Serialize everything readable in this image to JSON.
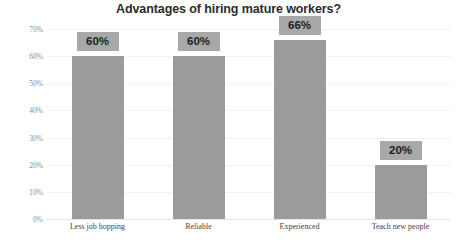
{
  "chart_data": {
    "type": "bar",
    "title": "Advantages of hiring mature workers?",
    "subtitle": "",
    "xlabel": "",
    "ylabel": "",
    "categories": [
      "Less job hopping",
      "Reliable",
      "Experienced",
      "Teach new people"
    ],
    "values": [
      60,
      60,
      66,
      20
    ],
    "data_labels": [
      "60%",
      "60%",
      "66%",
      "20%"
    ],
    "ylim": [
      0,
      70
    ],
    "ytick_values": [
      0,
      10,
      20,
      30,
      40,
      50,
      60,
      70
    ],
    "ytick_labels": [
      "0%",
      "10%",
      "20%",
      "30%",
      "40%",
      "50%",
      "60%",
      "70%"
    ],
    "grid": true,
    "legend": false,
    "legend_position": "none",
    "bar_color": "#9b9b9b",
    "data_label_background": "#a8a8a8",
    "data_label_text_color": "#1d1d1d",
    "title_color": "#2b2b2b",
    "axis_text_color": "#8d8d8d",
    "category_text_color": "#3f3f3f",
    "gridline_color": "#f2f2f2",
    "baseline_color": "#e4e4e4",
    "background_color": "#ffffff"
  }
}
